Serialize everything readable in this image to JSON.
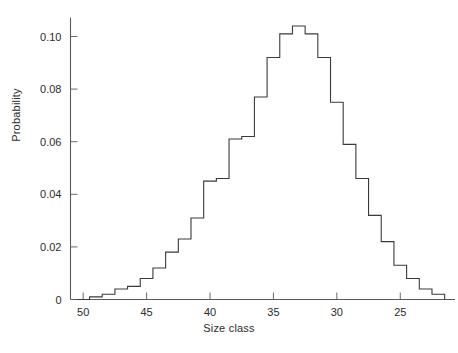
{
  "chart_data": {
    "type": "bar",
    "title": "",
    "subtitle": "",
    "xlabel": "Size class",
    "ylabel": "Probability",
    "grid": false,
    "legend": null,
    "legend_position": "none",
    "x_axis_reversed": true,
    "xlim": [
      51,
      21
    ],
    "ylim": [
      0,
      0.108
    ],
    "x_ticks": [
      50,
      45,
      40,
      35,
      30,
      25
    ],
    "x_tick_labels": [
      "50",
      "45",
      "40",
      "35",
      "30",
      "25"
    ],
    "y_ticks": [
      0,
      0.02,
      0.04,
      0.06,
      0.08,
      0.1
    ],
    "y_tick_labels": [
      "0",
      "0.02",
      "0.04",
      "0.06",
      "0.08",
      "0.10"
    ],
    "bin_width": 1,
    "categories": [
      50,
      49,
      48,
      47,
      46,
      45,
      44,
      43,
      42,
      41,
      40,
      39,
      38,
      37,
      36,
      35,
      34,
      33,
      32,
      31,
      30,
      29,
      28,
      27,
      26,
      25,
      24,
      23,
      22
    ],
    "values": [
      0.0,
      0.001,
      0.002,
      0.004,
      0.005,
      0.008,
      0.012,
      0.018,
      0.023,
      0.031,
      0.045,
      0.046,
      0.061,
      0.062,
      0.077,
      0.092,
      0.101,
      0.104,
      0.101,
      0.092,
      0.075,
      0.059,
      0.046,
      0.032,
      0.022,
      0.013,
      0.008,
      0.004,
      0.002
    ],
    "series": [
      {
        "name": "Probability",
        "values": [
          0.0,
          0.001,
          0.002,
          0.004,
          0.005,
          0.008,
          0.012,
          0.018,
          0.023,
          0.031,
          0.045,
          0.046,
          0.061,
          0.062,
          0.077,
          0.092,
          0.101,
          0.104,
          0.101,
          0.092,
          0.075,
          0.059,
          0.046,
          0.032,
          0.022,
          0.013,
          0.008,
          0.004,
          0.002
        ]
      }
    ],
    "annotations": [],
    "colors": {
      "line": "#3a3a3a",
      "axis": "#5a5a5a",
      "text": "#2b2b2b",
      "background": "#ffffff"
    }
  }
}
